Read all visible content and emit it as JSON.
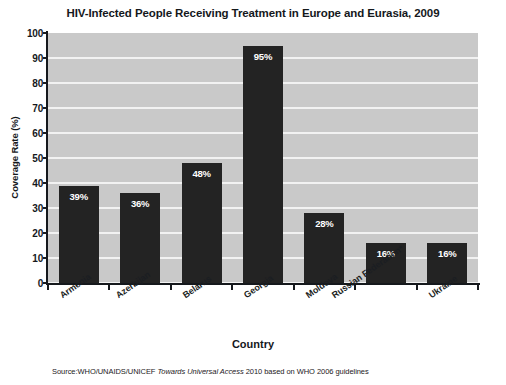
{
  "chart_data": {
    "type": "bar",
    "title": "HIV-Infected People Receiving Treatment in Europe and Eurasia, 2009",
    "xlabel": "Country",
    "ylabel": "Coverage Rate (%)",
    "ylim": [
      0,
      100
    ],
    "ytick_step": 10,
    "yticks": [
      "100",
      "90",
      "80",
      "70",
      "60",
      "50",
      "40",
      "30",
      "20",
      "10",
      "0"
    ],
    "grid": "horizontal",
    "legend": "none",
    "categories": [
      "Armenia",
      "Azerbijan",
      "Belarus",
      "Georgia",
      "Moldova",
      "Russian Federation*",
      "Ukraine"
    ],
    "values": [
      39,
      36,
      48,
      95,
      28,
      16,
      16
    ],
    "value_labels": [
      "39%",
      "36%",
      "48%",
      "95%",
      "28%",
      "16%",
      "16%"
    ],
    "colors": {
      "bar": "#232323",
      "plot_background": "#c9c9c9",
      "gridline": "#f2f2f2",
      "axis": "#15181c",
      "bar_label_text": "#ffffff",
      "page_background": "#ffffff"
    }
  },
  "footer": {
    "source_prefix": "Source:WHO/UNAIDS/UNICEF ",
    "source_italic": "Towards Universal Access",
    "source_suffix": " 2010 based on WHO 2006 guidelines"
  }
}
